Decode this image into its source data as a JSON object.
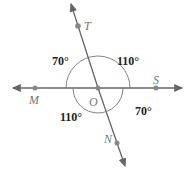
{
  "diagram": {
    "type": "intersecting-lines",
    "colors": {
      "line": "#666666",
      "point": "#888888",
      "arc": "#777777",
      "angle_text": "#222222",
      "point_text": "#777777"
    },
    "points": {
      "T": {
        "label": "T",
        "x": 78,
        "y": 26
      },
      "M": {
        "label": "M",
        "x": 35,
        "y": 88
      },
      "O": {
        "label": "O",
        "x": 98,
        "y": 88
      },
      "S": {
        "label": "S",
        "x": 156,
        "y": 88
      },
      "N": {
        "label": "N",
        "x": 117,
        "y": 143
      }
    },
    "angles": {
      "upper_left": "70°",
      "upper_right": "110°",
      "lower_left": "110°",
      "lower_right": "70°"
    }
  }
}
